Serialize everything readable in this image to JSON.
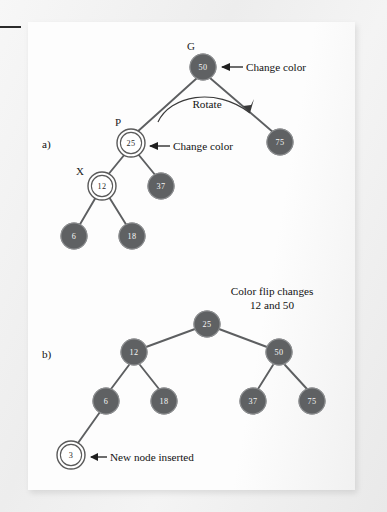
{
  "figure": {
    "title_caption": "",
    "panels": [
      {
        "id": "a",
        "label": "a)",
        "annotations": [
          {
            "name": "grandparent-label",
            "text": "G"
          },
          {
            "name": "parent-label",
            "text": "P"
          },
          {
            "name": "node-label",
            "text": "X"
          },
          {
            "name": "rotate-label",
            "text": "Rotate"
          },
          {
            "name": "change-color-top",
            "text": "Change color"
          },
          {
            "name": "change-color-mid",
            "text": "Change color"
          }
        ],
        "nodes": [
          {
            "value": "50",
            "color": "black",
            "style": "filled"
          },
          {
            "value": "25",
            "color": "red",
            "style": "double-circle"
          },
          {
            "value": "75",
            "color": "black",
            "style": "filled"
          },
          {
            "value": "12",
            "color": "red",
            "style": "double-circle"
          },
          {
            "value": "37",
            "color": "black",
            "style": "filled"
          },
          {
            "value": "6",
            "color": "black",
            "style": "filled"
          },
          {
            "value": "18",
            "color": "black",
            "style": "filled"
          }
        ]
      },
      {
        "id": "b",
        "label": "b)",
        "annotations": [
          {
            "name": "color-flip-line1",
            "text": "Color flip changes"
          },
          {
            "name": "color-flip-line2",
            "text": "12 and 50"
          },
          {
            "name": "new-node-note",
            "text": "New node inserted"
          }
        ],
        "nodes": [
          {
            "value": "25",
            "color": "black",
            "style": "filled"
          },
          {
            "value": "12",
            "color": "black",
            "style": "filled"
          },
          {
            "value": "50",
            "color": "black",
            "style": "filled"
          },
          {
            "value": "6",
            "color": "black",
            "style": "filled"
          },
          {
            "value": "18",
            "color": "black",
            "style": "filled"
          },
          {
            "value": "37",
            "color": "black",
            "style": "filled"
          },
          {
            "value": "75",
            "color": "black",
            "style": "filled"
          },
          {
            "value": "3",
            "color": "red",
            "style": "double-circle"
          }
        ]
      }
    ],
    "colors": {
      "node_fill": "#5f6163",
      "node_text": "#f6f6f6",
      "open_node_fill": "#ffffff",
      "open_node_text": "#2a2a2a",
      "edge": "#5d5f61",
      "annotation_text": "#121212",
      "page_background": "#fdfdfd",
      "scan_background": "#f2f2f2"
    }
  }
}
